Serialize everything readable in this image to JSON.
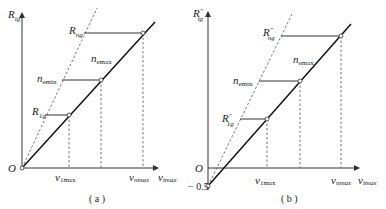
{
  "figure": {
    "panels": [
      {
        "id": "a",
        "caption": "( a )",
        "y_axis_label": {
          "main": "R",
          "sub": "ig"
        },
        "origin_label": "O",
        "x_ticks": [
          {
            "main": "v",
            "sub": "1max"
          },
          {
            "main": "v",
            "sub": "nmax"
          },
          {
            "main": "v",
            "sub": "imax"
          }
        ],
        "curve_labels": [
          {
            "main": "R",
            "sub": "ng"
          },
          {
            "main": "n",
            "sub": "emax"
          },
          {
            "main": "n",
            "sub": "emin"
          },
          {
            "main": "R",
            "sub": "1g"
          }
        ]
      },
      {
        "id": "b",
        "caption": "( b )",
        "y_axis_label": {
          "main": "R",
          "sup": "″",
          "sub": "ig"
        },
        "origin_label": "O",
        "y_offset_label": "− 0.5",
        "x_ticks": [
          {
            "main": "v",
            "sub": "1max"
          },
          {
            "main": "v",
            "sub": "nmax"
          },
          {
            "main": "v",
            "sub": "imax"
          }
        ],
        "curve_labels": [
          {
            "main": "R",
            "sup": "″",
            "sub": "ng"
          },
          {
            "main": "n",
            "sub": "emax"
          },
          {
            "main": "n",
            "sub": "emin"
          },
          {
            "main": "R",
            "sup": "″",
            "sub": "1g"
          }
        ]
      }
    ]
  }
}
